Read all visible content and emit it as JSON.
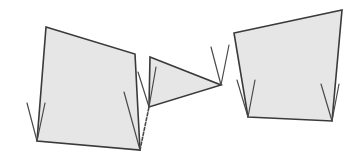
{
  "diagram": {
    "canvas": {
      "width": 358,
      "height": 162,
      "background": "#ffffff"
    },
    "colors": {
      "fill": "#e6e6e6",
      "stroke": "#3a3a3a",
      "marks": "#4a4a4a"
    },
    "shapes": [
      {
        "id": "left-quadrilateral",
        "points": [
          [
            46,
            27
          ],
          [
            135,
            54
          ],
          [
            140,
            150
          ],
          [
            37,
            141
          ]
        ],
        "marks": [
          {
            "vertex": [
              37,
              141
            ],
            "arms": [
              [
                27,
                103
              ],
              [
                45,
                103
              ]
            ],
            "dashed": [
              false,
              false
            ]
          },
          {
            "vertex": [
              140,
              150
            ],
            "arms": [
              [
                124,
                92
              ],
              [
                149,
                107
              ]
            ],
            "dashed": [
              false,
              true
            ]
          }
        ]
      },
      {
        "id": "middle-triangle",
        "points": [
          [
            150,
            57
          ],
          [
            221,
            85
          ],
          [
            149,
            107
          ]
        ],
        "marks": [
          {
            "vertex": [
              149,
              107
            ],
            "arms": [
              [
                138,
                72
              ],
              [
                156,
                67
              ]
            ],
            "dashed": [
              false,
              false
            ]
          },
          {
            "vertex": [
              221,
              85
            ],
            "arms": [
              [
                211,
                47
              ],
              [
                229,
                45
              ]
            ],
            "dashed": [
              false,
              false
            ]
          }
        ]
      },
      {
        "id": "right-quadrilateral",
        "points": [
          [
            234,
            33
          ],
          [
            342,
            10
          ],
          [
            332,
            121
          ],
          [
            248,
            117
          ]
        ],
        "marks": [
          {
            "vertex": [
              248,
              117
            ],
            "arms": [
              [
                237,
                80
              ],
              [
                255,
                80
              ]
            ],
            "dashed": [
              false,
              false
            ]
          },
          {
            "vertex": [
              332,
              121
            ],
            "arms": [
              [
                321,
                84
              ],
              [
                339,
                84
              ]
            ],
            "dashed": [
              false,
              false
            ]
          }
        ]
      }
    ]
  }
}
